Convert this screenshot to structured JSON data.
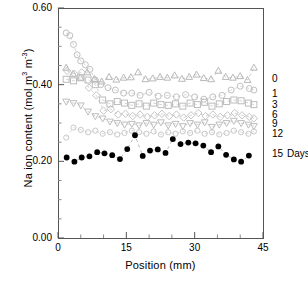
{
  "chart_data": {
    "type": "scatter",
    "title": "",
    "xlabel": "Position (mm)",
    "ylabel": "Na ion content (mol m3 m-3)",
    "ylabel_parts": {
      "prefix": "Na ion content (mol m",
      "sup1": "3",
      "mid": " m",
      "sup2": "-3",
      "suffix": ")"
    },
    "xlim": [
      0,
      45
    ],
    "ylim": [
      0.0,
      0.6
    ],
    "xticks": [
      "0",
      "15",
      "30",
      "45"
    ],
    "xtick_values": [
      0,
      15,
      30,
      45
    ],
    "yticks": [
      "0.00",
      "0.20",
      "0.40",
      "0.60"
    ],
    "ytick_values": [
      0.0,
      0.2,
      0.4,
      0.6
    ],
    "grid": false,
    "legend_position": "right-outside",
    "legend_unit": "Days",
    "frame": {
      "left": 58,
      "right": 263,
      "top": 8,
      "bottom": 238
    },
    "series": [
      {
        "name": "0",
        "label": "0",
        "marker": "triangle-up",
        "color": "#b8b8b8",
        "legend_y": 0.414,
        "trend_y": 0.418,
        "x": [
          1.8,
          3.3,
          4.9,
          6.4,
          8.0,
          9.6,
          11.2,
          12.8,
          14.4,
          16.0,
          17.6,
          19.2,
          20.8,
          22.4,
          24.0,
          25.6,
          27.2,
          28.8,
          30.4,
          32.0,
          33.6,
          35.2,
          36.8,
          38.4,
          40.0,
          41.6,
          43.0
        ],
        "y": [
          0.444,
          0.428,
          0.418,
          0.432,
          0.415,
          0.408,
          0.42,
          0.413,
          0.418,
          0.419,
          0.432,
          0.414,
          0.416,
          0.42,
          0.418,
          0.424,
          0.415,
          0.42,
          0.426,
          0.417,
          0.414,
          0.436,
          0.42,
          0.418,
          0.422,
          0.412,
          0.444
        ]
      },
      {
        "name": "1",
        "label": "1",
        "marker": "circle-open",
        "color": "#c0c0c0",
        "legend_y": 0.375,
        "trend_y": 0.378,
        "x": [
          1.8,
          2.6,
          3.4,
          4.2,
          5.0,
          6.0,
          7.0,
          8.2,
          9.4,
          11.0,
          12.6,
          14.4,
          16.2,
          18.0,
          20.0,
          22.0,
          24.0,
          26.0,
          28.0,
          30.0,
          32.0,
          34.0,
          36.0,
          38.0,
          40.0,
          42.0,
          43.0
        ],
        "y": [
          0.535,
          0.528,
          0.505,
          0.478,
          0.462,
          0.452,
          0.44,
          0.412,
          0.4,
          0.392,
          0.386,
          0.378,
          0.378,
          0.372,
          0.38,
          0.37,
          0.372,
          0.368,
          0.374,
          0.368,
          0.362,
          0.368,
          0.372,
          0.386,
          0.396,
          0.39,
          0.386
        ]
      },
      {
        "name": "3",
        "label": "3",
        "marker": "square-open",
        "color": "#bcbcbc",
        "legend_y": 0.348,
        "trend_y": 0.35,
        "x": [
          1.8,
          3.4,
          5.0,
          6.6,
          8.2,
          9.8,
          11.4,
          13.0,
          14.6,
          16.2,
          17.8,
          19.4,
          21.0,
          22.6,
          24.2,
          25.8,
          27.4,
          29.0,
          30.6,
          32.2,
          33.8,
          35.4,
          37.0,
          38.6,
          40.2,
          41.8,
          43.0
        ],
        "y": [
          0.414,
          0.41,
          0.418,
          0.412,
          0.4,
          0.36,
          0.35,
          0.356,
          0.352,
          0.346,
          0.35,
          0.344,
          0.352,
          0.348,
          0.346,
          0.35,
          0.344,
          0.352,
          0.348,
          0.354,
          0.344,
          0.35,
          0.356,
          0.36,
          0.358,
          0.352,
          0.348
        ]
      },
      {
        "name": "6",
        "label": "6",
        "marker": "diamond-open",
        "color": "#c4c4c4",
        "legend_y": 0.322,
        "trend_y": 0.32,
        "x": [
          2.0,
          3.6,
          5.2,
          6.8,
          8.4,
          10.0,
          11.6,
          13.2,
          14.8,
          16.4,
          18.0,
          19.6,
          21.2,
          22.8,
          24.4,
          26.0,
          27.6,
          29.2,
          30.8,
          32.4,
          34.0,
          35.6,
          37.2,
          38.8,
          40.4,
          42.0,
          43.0
        ],
        "y": [
          0.436,
          0.428,
          0.432,
          0.392,
          0.372,
          0.332,
          0.336,
          0.322,
          0.324,
          0.318,
          0.322,
          0.316,
          0.32,
          0.324,
          0.318,
          0.322,
          0.314,
          0.32,
          0.326,
          0.318,
          0.322,
          0.316,
          0.32,
          0.326,
          0.32,
          0.316,
          0.312
        ]
      },
      {
        "name": "9",
        "label": "9",
        "marker": "triangle-down",
        "color": "#bdbdbd",
        "legend_y": 0.297,
        "trend_y": 0.296,
        "x": [
          1.8,
          3.4,
          5.0,
          6.6,
          8.2,
          9.8,
          11.4,
          13.0,
          14.6,
          16.2,
          17.8,
          19.4,
          21.0,
          22.6,
          24.2,
          25.8,
          27.4,
          29.0,
          30.6,
          32.2,
          33.8,
          35.4,
          37.0,
          38.6,
          40.2,
          41.8,
          43.0
        ],
        "y": [
          0.356,
          0.352,
          0.346,
          0.33,
          0.318,
          0.312,
          0.304,
          0.3,
          0.296,
          0.298,
          0.294,
          0.3,
          0.296,
          0.302,
          0.294,
          0.298,
          0.292,
          0.3,
          0.296,
          0.302,
          0.29,
          0.296,
          0.3,
          0.306,
          0.3,
          0.296,
          0.292
        ]
      },
      {
        "name": "12",
        "label": "12",
        "marker": "circle-open-small",
        "color": "#c8c8c8",
        "legend_y": 0.272,
        "trend_y": 0.276,
        "x": [
          1.8,
          3.4,
          5.0,
          6.6,
          8.2,
          9.8,
          11.4,
          13.0,
          14.6,
          16.2,
          17.8,
          19.4,
          21.0,
          22.6,
          24.2,
          25.8,
          27.4,
          29.0,
          30.6,
          32.2,
          33.8,
          35.4,
          37.0,
          38.6,
          40.2,
          41.8,
          43.0
        ],
        "y": [
          0.262,
          0.288,
          0.282,
          0.276,
          0.28,
          0.272,
          0.276,
          0.27,
          0.274,
          0.28,
          0.276,
          0.272,
          0.278,
          0.27,
          0.276,
          0.272,
          0.278,
          0.274,
          0.28,
          0.272,
          0.276,
          0.27,
          0.274,
          0.28,
          0.276,
          0.272,
          0.278
        ]
      },
      {
        "name": "15",
        "label": "15",
        "marker": "circle-filled",
        "color": "#000000",
        "legend_y": 0.218,
        "trend_y": 0.216,
        "x": [
          1.9,
          3.6,
          5.2,
          6.9,
          8.6,
          10.2,
          11.9,
          13.6,
          15.2,
          16.9,
          18.6,
          20.2,
          21.9,
          23.6,
          25.2,
          26.9,
          28.6,
          30.2,
          31.9,
          33.6,
          35.2,
          36.9,
          38.6,
          40.2,
          41.9
        ],
        "y": [
          0.21,
          0.199,
          0.21,
          0.213,
          0.224,
          0.221,
          0.216,
          0.206,
          0.232,
          0.268,
          0.214,
          0.228,
          0.231,
          0.222,
          0.258,
          0.245,
          0.249,
          0.247,
          0.241,
          0.224,
          0.239,
          0.217,
          0.205,
          0.199,
          0.215
        ]
      }
    ]
  }
}
